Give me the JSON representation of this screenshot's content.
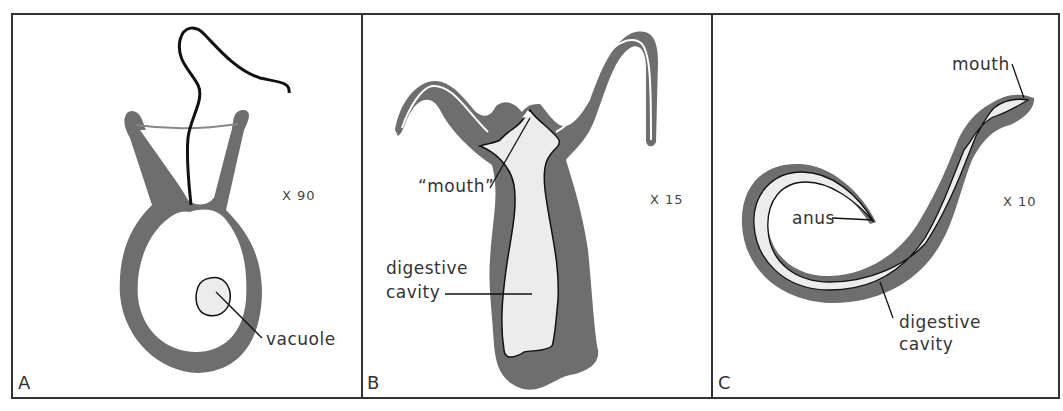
{
  "figure": {
    "colors": {
      "frame": "#333333",
      "wall": "#6e6e6e",
      "cavity": "#ececec",
      "line": "#111111",
      "text": "#333333"
    },
    "panels": [
      {
        "letter": "A",
        "magnification": "X 90",
        "labels": {
          "vacuole": "vacuole"
        }
      },
      {
        "letter": "B",
        "magnification": "X 15",
        "labels": {
          "mouth": "“mouth”",
          "digestive_1": "digestive",
          "digestive_2": "cavity"
        }
      },
      {
        "letter": "C",
        "magnification": "X 10",
        "labels": {
          "mouth": "mouth",
          "anus": "anus",
          "digestive_1": "digestive",
          "digestive_2": "cavity"
        }
      }
    ]
  }
}
